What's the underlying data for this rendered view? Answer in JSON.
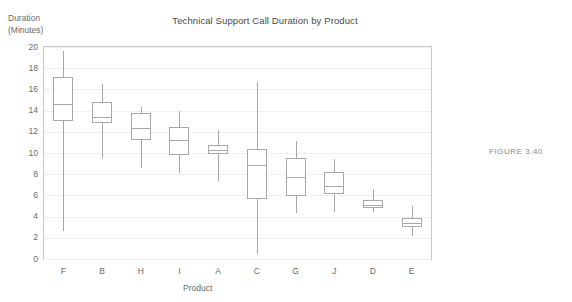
{
  "chart_data": {
    "type": "box",
    "title": "Technical Support Call Duration by Product",
    "xlabel": "Product",
    "ylabel_line1": "Duration",
    "ylabel_line2": "(Minutes)",
    "ylim": [
      0,
      20
    ],
    "ytick_values": [
      0,
      2,
      4,
      6,
      8,
      10,
      12,
      14,
      16,
      18,
      20
    ],
    "ytick_labels": [
      "0",
      "2",
      "4",
      "6",
      "8",
      "10",
      "12",
      "14",
      "16",
      "18",
      "20"
    ],
    "grid": true,
    "legend": "none",
    "categories": [
      "F",
      "B",
      "H",
      "I",
      "A",
      "C",
      "G",
      "J",
      "D",
      "E"
    ],
    "boxes": [
      {
        "category": "F",
        "whisker_low": 2.6,
        "q1": 13.0,
        "median": 14.6,
        "q3": 17.2,
        "whisker_high": 19.6
      },
      {
        "category": "B",
        "whisker_low": 9.5,
        "q1": 12.8,
        "median": 13.4,
        "q3": 14.8,
        "whisker_high": 16.5
      },
      {
        "category": "H",
        "whisker_low": 8.6,
        "q1": 11.2,
        "median": 12.4,
        "q3": 13.8,
        "whisker_high": 14.3
      },
      {
        "category": "I",
        "whisker_low": 8.1,
        "q1": 9.8,
        "median": 11.2,
        "q3": 12.5,
        "whisker_high": 14.0
      },
      {
        "category": "A",
        "whisker_low": 7.4,
        "q1": 9.9,
        "median": 10.3,
        "q3": 10.8,
        "whisker_high": 12.2
      },
      {
        "category": "C",
        "whisker_low": 0.5,
        "q1": 5.7,
        "median": 8.9,
        "q3": 10.4,
        "whisker_high": 16.7
      },
      {
        "category": "G",
        "whisker_low": 4.3,
        "q1": 5.9,
        "median": 7.7,
        "q3": 9.5,
        "whisker_high": 11.1
      },
      {
        "category": "J",
        "whisker_low": 4.4,
        "q1": 6.1,
        "median": 6.9,
        "q3": 8.2,
        "whisker_high": 9.4
      },
      {
        "category": "D",
        "whisker_low": 4.4,
        "q1": 4.8,
        "median": 5.1,
        "q3": 5.6,
        "whisker_high": 6.6
      },
      {
        "category": "E",
        "whisker_low": 2.2,
        "q1": 3.0,
        "median": 3.4,
        "q3": 3.9,
        "whisker_high": 5.0
      }
    ],
    "colors": {
      "box_stroke": "#a8a8a8",
      "box_fill": "#ffffff",
      "grid": "#f0f0f0",
      "axis": "#c9c9c9",
      "text": "#6b6b6b",
      "title_text": "#4a4a4a",
      "caption_text": "#8a8a8a"
    }
  },
  "caption": {
    "figure_label": "FIGURE 3.40"
  }
}
